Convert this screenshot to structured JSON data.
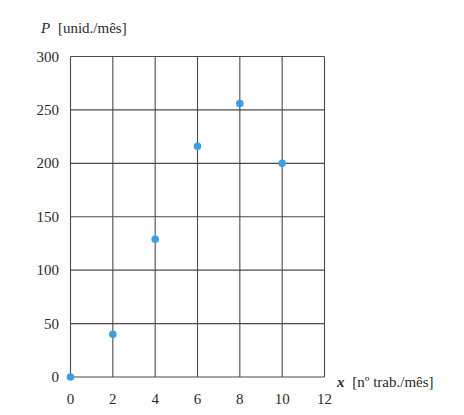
{
  "chart_data": {
    "type": "scatter",
    "title": "",
    "xlabel": "x [nº trab./mês]",
    "xlabel_var": "x",
    "xlabel_unit": "[nº trab./mês]",
    "ylabel": "P [unid./mês]",
    "ylabel_var": "P",
    "ylabel_unit": "[unid./mês]",
    "xlim": [
      0,
      12
    ],
    "ylim": [
      0,
      300
    ],
    "xticks": [
      0,
      2,
      4,
      6,
      8,
      10,
      12
    ],
    "yticks": [
      0,
      50,
      100,
      150,
      200,
      250,
      300
    ],
    "grid": true,
    "legend": null,
    "marker_color": "#3d9fe0",
    "series": [
      {
        "name": "P",
        "points": [
          {
            "x": 0,
            "y": 0
          },
          {
            "x": 2,
            "y": 40
          },
          {
            "x": 4,
            "y": 129
          },
          {
            "x": 6,
            "y": 216
          },
          {
            "x": 8,
            "y": 256
          },
          {
            "x": 10,
            "y": 200
          }
        ]
      }
    ]
  },
  "labels": {
    "xtick_0": "0",
    "xtick_2": "2",
    "xtick_4": "4",
    "xtick_6": "6",
    "xtick_8": "8",
    "xtick_10": "10",
    "xtick_12": "12",
    "ytick_0": "0",
    "ytick_50": "50",
    "ytick_100": "100",
    "ytick_150": "150",
    "ytick_200": "200",
    "ytick_250": "250",
    "ytick_300": "300"
  }
}
